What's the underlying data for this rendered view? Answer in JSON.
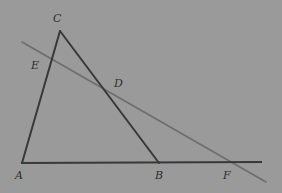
{
  "figure": {
    "canvas": {
      "width": 282,
      "height": 193,
      "background": "#9a9a9a"
    },
    "styles": {
      "primary_stroke": "#383838",
      "primary_width": 2.0,
      "secondary_stroke": "#6d6d6d",
      "secondary_width": 1.6,
      "label_color": "#2e2e2e"
    },
    "points": {
      "A": {
        "x": 22,
        "y": 163,
        "label": "A",
        "label_x": 15,
        "label_y": 170
      },
      "B": {
        "x": 159,
        "y": 163,
        "label": "B",
        "label_x": 155,
        "label_y": 170
      },
      "C": {
        "x": 60,
        "y": 31,
        "label": "C",
        "label_x": 53,
        "label_y": 13
      },
      "D": {
        "x": 110,
        "y": 95,
        "label": "D",
        "label_x": 114,
        "label_y": 78
      },
      "E": {
        "x": 46,
        "y": 58,
        "label": "E",
        "label_x": 31,
        "label_y": 60
      },
      "F": {
        "x": 228,
        "y": 162,
        "label": "F",
        "label_x": 223,
        "label_y": 170
      }
    },
    "segments": [
      {
        "name": "segment-AC",
        "from": "A",
        "to": "C",
        "kind": "primary",
        "x1": 22,
        "y1": 163,
        "x2": 60,
        "y2": 31
      },
      {
        "name": "segment-CB",
        "from": "C",
        "to": "B",
        "kind": "primary",
        "x1": 60,
        "y1": 31,
        "x2": 159,
        "y2": 163
      },
      {
        "name": "segment-AF-baseline",
        "from": "A",
        "to": "right-edge",
        "kind": "primary",
        "x1": 21,
        "y1": 163,
        "x2": 262,
        "y2": 162
      },
      {
        "name": "transversal-line-EDF",
        "from": "upper-left",
        "to": "lower-right",
        "kind": "secondary",
        "x1": 22,
        "y1": 42,
        "x2": 266,
        "y2": 182
      }
    ],
    "labels_order": [
      "C",
      "E",
      "D",
      "A",
      "B",
      "F"
    ]
  }
}
